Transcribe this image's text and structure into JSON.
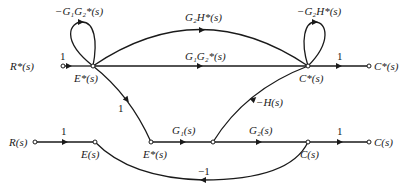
{
  "diagram": {
    "type": "signal-flow-graph",
    "sampled_graph": {
      "nodes": [
        {
          "id": "Rstar_in",
          "label": "R*(s)"
        },
        {
          "id": "Estar",
          "label": "E*(s)"
        },
        {
          "id": "Cstar",
          "label": "C*(s)"
        },
        {
          "id": "Cstar_out",
          "label": "C*(s)"
        }
      ],
      "edges": [
        {
          "from": "Rstar_in",
          "to": "Estar",
          "gain": "1"
        },
        {
          "from": "Estar",
          "to": "Estar",
          "gain": "−G₁G₂*(s)",
          "kind": "self-loop"
        },
        {
          "from": "Estar",
          "to": "Cstar",
          "gain": "G₂H*(s)",
          "kind": "arc"
        },
        {
          "from": "Estar",
          "to": "Cstar",
          "gain": "G₁G₂*(s)"
        },
        {
          "from": "Cstar",
          "to": "Cstar",
          "gain": "−G₂H*(s)",
          "kind": "self-loop"
        },
        {
          "from": "Cstar",
          "to": "Cstar_out",
          "gain": "1"
        },
        {
          "from": "Estar",
          "to": "Estar_b",
          "gain": "1"
        },
        {
          "from": "mid_b",
          "to": "Cstar",
          "gain": "−H(s)"
        }
      ]
    },
    "continuous_graph": {
      "nodes": [
        {
          "id": "R_in",
          "label": "R(s)"
        },
        {
          "id": "E",
          "label": "E(s)"
        },
        {
          "id": "Estar_b",
          "label": "E*(s)"
        },
        {
          "id": "mid_b",
          "label": ""
        },
        {
          "id": "C",
          "label": "C(s)"
        },
        {
          "id": "C_out",
          "label": "C(s)"
        }
      ],
      "edges": [
        {
          "from": "R_in",
          "to": "E",
          "gain": "1"
        },
        {
          "from": "Estar_b",
          "to": "mid_b",
          "gain": "G₁(s)"
        },
        {
          "from": "mid_b",
          "to": "C",
          "gain": "G₂(s)"
        },
        {
          "from": "C",
          "to": "C_out",
          "gain": "1"
        },
        {
          "from": "C",
          "to": "E",
          "gain": "−1",
          "kind": "arc"
        }
      ]
    }
  },
  "labels": {
    "r_star": "R*(s)",
    "e_star": "E*(s)",
    "c_star": "C*(s)",
    "c_star_out": "C*(s)",
    "r": "R(s)",
    "e": "E(s)",
    "e_star_b": "E*(s)",
    "c": "C(s)",
    "c_out": "C(s)",
    "gain_r_e_star": "1",
    "gain_loop_e": "−G₁G₂*(s)",
    "gain_arc_top": "G₂H*(s)",
    "gain_straight_top": "G₁G₂*(s)",
    "gain_loop_c": "−G₂H*(s)",
    "gain_c_star_out": "1",
    "gain_e_star_down": "1",
    "gain_minus_h": "−H(s)",
    "gain_r_e": "1",
    "gain_g1": "G₁(s)",
    "gain_g2": "G₂(s)",
    "gain_c_out": "1",
    "gain_feedback": "−1"
  }
}
